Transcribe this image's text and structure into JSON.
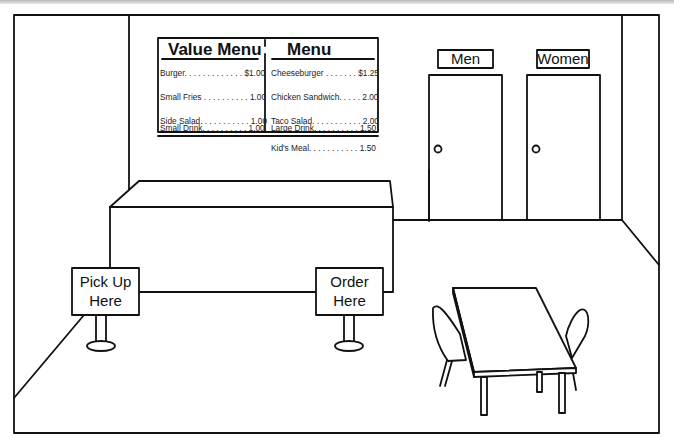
{
  "scene": {
    "description": "Line drawing of a fast food restaurant interior",
    "colors": {
      "line": "#111111",
      "background": "#ffffff"
    }
  },
  "menu_board": {
    "value_menu": {
      "title": "Value Menu",
      "items": [
        {
          "label": "Burger. . . . . . . . . . . . . $1.00"
        },
        {
          "label": "Small Fries . . . . . . . . . . 1.00"
        },
        {
          "label": "Side Salad. . . . . . . . . . . 1.00"
        },
        {
          "label": "Small Drink. . . . . . . . . . 1.00"
        }
      ]
    },
    "menu": {
      "title": "Menu",
      "items": [
        {
          "label": "Cheeseburger . . . . . . . $1.25"
        },
        {
          "label": "Chicken Sandwich. . . . . 2.00"
        },
        {
          "label": "Taco Salad. . . . . . . . . . . 2.00"
        },
        {
          "label": "Large Drink. . . . . . . . . . 1.50"
        },
        {
          "label": "Kid's Meal. . . . . . . . . . . 1.50"
        }
      ]
    }
  },
  "restrooms": {
    "men": {
      "label": "Men"
    },
    "women": {
      "label": "Women"
    }
  },
  "signs": {
    "pickup": {
      "line1": "Pick Up",
      "line2": "Here"
    },
    "order": {
      "line1": "Order",
      "line2": "Here"
    }
  }
}
